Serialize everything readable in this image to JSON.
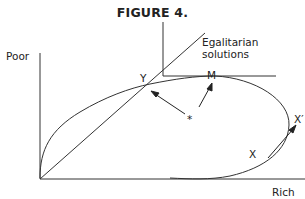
{
  "figure": {
    "title": "FIGURE 4.",
    "axis_y_label": "Poor",
    "axis_x_label": "Rich",
    "line_label": "Egalitarian solutions",
    "points": {
      "Y": "Y",
      "M": "M",
      "X": "X",
      "X_prime": "X′",
      "star": "*"
    }
  }
}
